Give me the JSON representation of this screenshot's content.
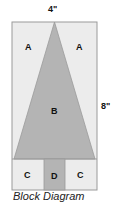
{
  "diagram": {
    "dimensions": {
      "width_label": "4\"",
      "height_label": "8\""
    },
    "pieces": [
      {
        "id": "A-left",
        "label": "A"
      },
      {
        "id": "A-right",
        "label": "A"
      },
      {
        "id": "B",
        "label": "B"
      },
      {
        "id": "C-left",
        "label": "C"
      },
      {
        "id": "D",
        "label": "D"
      },
      {
        "id": "C-right",
        "label": "C"
      }
    ],
    "colors": {
      "light": "#ececec",
      "dark": "#b4b4b4",
      "outline": "#9a9a9a"
    },
    "caption": "Block Diagram"
  }
}
